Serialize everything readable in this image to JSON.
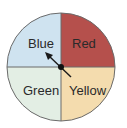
{
  "spinner": {
    "sections": [
      {
        "label": "Blue",
        "color": "#cfe3f0"
      },
      {
        "label": "Red",
        "color": "#b5504c"
      },
      {
        "label": "Green",
        "color": "#e3eee4"
      },
      {
        "label": "Yellow",
        "color": "#f4dcae"
      }
    ],
    "pointer": {
      "points_to": "Blue"
    }
  }
}
